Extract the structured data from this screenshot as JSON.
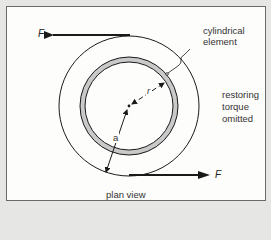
{
  "diagram": {
    "type": "mechanics-schematic",
    "view_label": "plan view",
    "labels": {
      "cylinder_label_line1": "cylindrical",
      "cylinder_label_line2": "element",
      "torque_line1": "restoring",
      "torque_line2": "torque",
      "torque_line3": "omitted",
      "force_top": "F",
      "force_bottom": "F",
      "radius_r": "r",
      "radius_a": "a"
    },
    "geometry": {
      "center": [
        129,
        106
      ],
      "outer_radius": 70,
      "ring_outer_radius": 49,
      "ring_inner_radius": 44
    },
    "colors": {
      "line": "#1a1a1a",
      "ring_fill": "#c9c9c9",
      "background": "#fdfdfb",
      "page": "#e6e6e4"
    }
  }
}
